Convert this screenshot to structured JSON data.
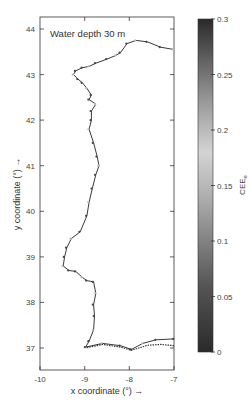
{
  "chart_data": {
    "type": "scatter",
    "title": "",
    "annotation": "Water depth 30 m",
    "xlabel": "x coordinate (°) →",
    "ylabel": "y coordinate (°) →",
    "xlim": [
      -10,
      -7
    ],
    "ylim": [
      36.5,
      44.3
    ],
    "xticks": [
      "-10",
      "-9",
      "-8",
      "-7"
    ],
    "yticks": [
      "37",
      "38",
      "39",
      "40",
      "41",
      "42",
      "43",
      "44"
    ],
    "grid": false,
    "colorbar": {
      "label": "CEE",
      "label_subscript": "e",
      "range": [
        0,
        0.3
      ],
      "ticks": [
        "0",
        "0.05",
        "0.1",
        "0.15",
        "0.2",
        "0.25",
        "0.3"
      ],
      "colormap": "gray",
      "low_color": "#2a2a2a",
      "mid_color": "#cfcfcf",
      "high_color": "#2a2a2a"
    },
    "series": [
      {
        "name": "coastline",
        "style": "line",
        "color": "#222222",
        "points": [
          [
            -7.0,
            43.55
          ],
          [
            -7.3,
            43.6
          ],
          [
            -7.6,
            43.72
          ],
          [
            -7.85,
            43.75
          ],
          [
            -8.05,
            43.68
          ],
          [
            -8.2,
            43.48
          ],
          [
            -8.3,
            43.42
          ],
          [
            -8.5,
            43.34
          ],
          [
            -8.75,
            43.25
          ],
          [
            -8.9,
            43.18
          ],
          [
            -9.05,
            43.15
          ],
          [
            -9.2,
            43.08
          ],
          [
            -9.25,
            43.0
          ],
          [
            -9.15,
            42.9
          ],
          [
            -9.05,
            42.82
          ],
          [
            -8.95,
            42.7
          ],
          [
            -8.85,
            42.55
          ],
          [
            -8.9,
            42.45
          ],
          [
            -8.75,
            42.35
          ],
          [
            -8.85,
            42.2
          ],
          [
            -8.85,
            42.0
          ],
          [
            -8.9,
            41.8
          ],
          [
            -8.8,
            41.5
          ],
          [
            -8.72,
            41.2
          ],
          [
            -8.68,
            41.0
          ],
          [
            -8.75,
            40.8
          ],
          [
            -8.83,
            40.5
          ],
          [
            -8.9,
            40.2
          ],
          [
            -8.95,
            39.9
          ],
          [
            -9.1,
            39.55
          ],
          [
            -9.3,
            39.4
          ],
          [
            -9.4,
            39.2
          ],
          [
            -9.45,
            39.0
          ],
          [
            -9.48,
            38.8
          ],
          [
            -9.35,
            38.7
          ],
          [
            -9.2,
            38.68
          ],
          [
            -9.05,
            38.55
          ],
          [
            -8.95,
            38.48
          ],
          [
            -8.8,
            38.45
          ],
          [
            -8.75,
            38.2
          ],
          [
            -8.8,
            37.95
          ],
          [
            -8.78,
            37.7
          ],
          [
            -8.8,
            37.4
          ],
          [
            -8.9,
            37.15
          ],
          [
            -8.98,
            37.02
          ],
          [
            -8.6,
            37.1
          ],
          [
            -8.2,
            37.05
          ],
          [
            -7.95,
            36.97
          ],
          [
            -7.7,
            37.1
          ],
          [
            -7.4,
            37.18
          ],
          [
            -7.0,
            37.2
          ]
        ]
      },
      {
        "name": "offshore-points",
        "style": "markers",
        "color_by": "CEE_e",
        "points": [
          [
            -7.0,
            37.05
          ],
          [
            -7.3,
            37.08
          ],
          [
            -7.6,
            37.06
          ],
          [
            -7.95,
            36.95
          ],
          [
            -8.2,
            37.02
          ],
          [
            -8.6,
            37.08
          ],
          [
            -8.98,
            37.0
          ]
        ]
      }
    ]
  }
}
